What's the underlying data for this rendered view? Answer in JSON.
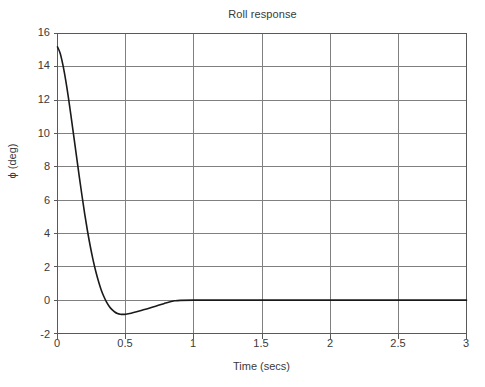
{
  "chart_data": {
    "type": "line",
    "title": "Roll response",
    "xlabel": "Time (secs)",
    "ylabel": "ϕ (deg)",
    "xlim": [
      0,
      3
    ],
    "ylim": [
      -2,
      16
    ],
    "xticks": [
      "0",
      "0.5",
      "1",
      "1.5",
      "2",
      "2.5",
      "3"
    ],
    "xtick_values": [
      0,
      0.5,
      1,
      1.5,
      2,
      2.5,
      3
    ],
    "yticks": [
      "-2",
      "0",
      "2",
      "4",
      "6",
      "8",
      "10",
      "12",
      "14",
      "16"
    ],
    "ytick_values": [
      -2,
      0,
      2,
      4,
      6,
      8,
      10,
      12,
      14,
      16
    ],
    "grid": true,
    "legend": null,
    "legend_position": "none",
    "line_color": "#1a1a1a",
    "grid_color": "#808080",
    "axis_color": "#595959",
    "background_color": "#ffffff",
    "series": [
      {
        "name": "roll angle",
        "x": [
          0.0,
          0.02,
          0.04,
          0.06,
          0.08,
          0.1,
          0.12,
          0.14,
          0.16,
          0.18,
          0.2,
          0.22,
          0.24,
          0.26,
          0.28,
          0.3,
          0.32,
          0.34,
          0.36,
          0.38,
          0.4,
          0.42,
          0.44,
          0.46,
          0.48,
          0.5,
          0.54,
          0.58,
          0.62,
          0.66,
          0.7,
          0.74,
          0.78,
          0.82,
          0.86,
          0.9,
          1.0,
          1.2,
          1.5,
          2.0,
          2.5,
          3.0
        ],
        "values": [
          15.2,
          14.8,
          14.1,
          13.2,
          12.15,
          11.0,
          9.8,
          8.6,
          7.4,
          6.25,
          5.15,
          4.15,
          3.25,
          2.45,
          1.75,
          1.15,
          0.63,
          0.22,
          -0.12,
          -0.38,
          -0.57,
          -0.71,
          -0.8,
          -0.84,
          -0.85,
          -0.84,
          -0.78,
          -0.7,
          -0.61,
          -0.51,
          -0.41,
          -0.31,
          -0.21,
          -0.11,
          -0.04,
          -0.01,
          0.0,
          0.0,
          0.0,
          0.0,
          0.0,
          0.0
        ]
      }
    ],
    "annotations": {
      "initial_value": 15.2,
      "minimum_value": -0.85,
      "minimum_time": 0.46,
      "steady_state": 0.0,
      "settling_time": 0.9
    }
  }
}
